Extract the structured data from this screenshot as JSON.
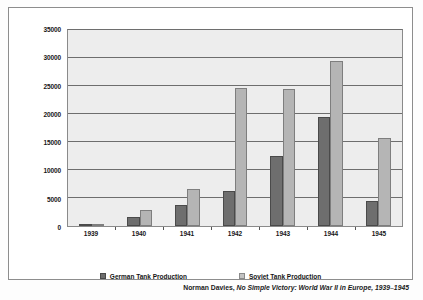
{
  "chart_data": {
    "type": "bar",
    "title": "",
    "subtitle": "",
    "xlabel": "",
    "ylabel": "",
    "categories": [
      "1939",
      "1940",
      "1941",
      "1942",
      "1943",
      "1944",
      "1945"
    ],
    "series": [
      {
        "name": "German Tank Production",
        "color": "#6e6e6e",
        "values": [
          247,
          1643,
          3790,
          6180,
          12460,
          19500,
          4400
        ]
      },
      {
        "name": "Soviet Tank Production",
        "color": "#b5b5b5",
        "values": [
          100,
          2790,
          6590,
          24700,
          24400,
          29500,
          15700
        ]
      }
    ],
    "ylim": [
      0,
      35000
    ],
    "yticks": [
      0,
      5000,
      10000,
      15000,
      20000,
      25000,
      30000,
      35000
    ],
    "ytick_labels": [
      "0",
      "5000",
      "10000",
      "15000",
      "20000",
      "25000",
      "30000",
      "35000"
    ],
    "grid": true,
    "grid_axis": "y",
    "legend_position": "bottom"
  },
  "legend": {
    "items": [
      {
        "label": "German Tank Production",
        "swatch": "german"
      },
      {
        "label": "Soviet Tank Production",
        "swatch": "soviet"
      }
    ]
  },
  "caption": {
    "author": "Norman Davies,",
    "title": "No Simple Victory: World War II in Europe, 1939–1945"
  }
}
